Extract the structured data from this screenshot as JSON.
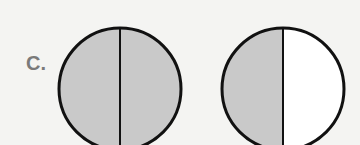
{
  "label": "C.",
  "colors": {
    "background": "#f4f4f2",
    "shaded": "#c9c9c9",
    "unshaded": "#ffffff",
    "outline": "#111111",
    "label": "#7a7a7a"
  },
  "circles": [
    {
      "name": "left-circle",
      "left_half": "shaded",
      "right_half": "shaded",
      "fraction_shaded": "2/2"
    },
    {
      "name": "right-circle",
      "left_half": "shaded",
      "right_half": "unshaded",
      "fraction_shaded": "1/2"
    }
  ]
}
